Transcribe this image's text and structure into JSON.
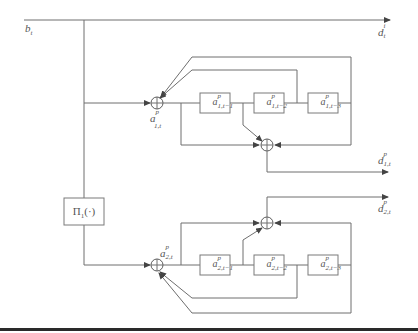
{
  "diagram": {
    "type": "block-diagram",
    "colors": {
      "lines": "#6e6e6e",
      "arrows": "#444444",
      "text": "#555555",
      "rule": "#2a2a2a"
    },
    "input": {
      "base": "b",
      "sub": "t"
    },
    "outputs": {
      "direct": {
        "base": "d",
        "sup": "i",
        "sub": "t"
      },
      "branch1": {
        "base": "d",
        "sup": "p",
        "sub": "1,t"
      },
      "branch2": {
        "base": "d",
        "sup": "p",
        "sub": "2,t"
      }
    },
    "operator": {
      "label": "Π",
      "sub": "1",
      "arg": "(·)"
    },
    "branch1": {
      "sum_label": {
        "base": "a",
        "sup": "p",
        "sub": "1,t"
      },
      "delays": [
        {
          "base": "a",
          "sup": "p",
          "sub": "1,t−1"
        },
        {
          "base": "a",
          "sup": "p",
          "sub": "1,t−2"
        },
        {
          "base": "a",
          "sup": "p",
          "sub": "1,t−3"
        }
      ]
    },
    "branch2": {
      "sum_label": {
        "base": "a",
        "sup": "p",
        "sub": "2,t"
      },
      "delays": [
        {
          "base": "a",
          "sup": "p",
          "sub": "2,t−1"
        },
        {
          "base": "a",
          "sup": "p",
          "sub": "2,t−2"
        },
        {
          "base": "a",
          "sup": "p",
          "sub": "2,t−3"
        }
      ]
    }
  }
}
